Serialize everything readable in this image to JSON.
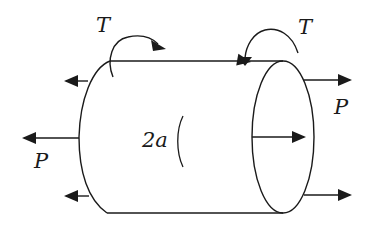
{
  "diagram": {
    "type": "cylinder-under-combined-loading",
    "labels": {
      "torque_left": "T",
      "torque_right": "T",
      "axial_left": "P",
      "axial_right": "P",
      "diameter": "2a"
    },
    "colors": {
      "stroke": "#1a1a1a",
      "background": "#ffffff"
    }
  }
}
